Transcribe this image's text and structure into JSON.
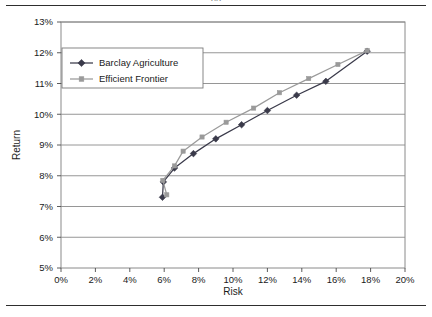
{
  "figure": {
    "top_rule": "horizontal-rule",
    "bottom_rule": "horizontal-rule",
    "clipped_title_fragment": "pg"
  },
  "chart_data": {
    "type": "line",
    "title": "",
    "xlabel": "Risk",
    "ylabel": "Return",
    "xlim": [
      0,
      20
    ],
    "ylim": [
      5,
      13
    ],
    "x_tick_labels": [
      "0%",
      "2%",
      "4%",
      "6%",
      "8%",
      "10%",
      "12%",
      "14%",
      "16%",
      "18%",
      "20%"
    ],
    "x_ticks": [
      0,
      2,
      4,
      6,
      8,
      10,
      12,
      14,
      16,
      18,
      20
    ],
    "y_tick_labels": [
      "5%",
      "6%",
      "7%",
      "8%",
      "9%",
      "10%",
      "11%",
      "12%",
      "13%"
    ],
    "y_ticks": [
      5,
      6,
      7,
      8,
      9,
      10,
      11,
      12,
      13
    ],
    "grid": "horizontal",
    "legend_position": "upper-left-inside",
    "series": [
      {
        "name": "Barclay Agriculture",
        "color": "#3a3a4a",
        "marker": "diamond",
        "points": [
          [
            5.9,
            7.3
          ],
          [
            5.95,
            7.8
          ],
          [
            6.6,
            8.25
          ],
          [
            7.7,
            8.72
          ],
          [
            9.0,
            9.2
          ],
          [
            10.5,
            9.66
          ],
          [
            12.0,
            10.12
          ],
          [
            13.7,
            10.62
          ],
          [
            15.4,
            11.07
          ],
          [
            17.8,
            12.05
          ]
        ]
      },
      {
        "name": "Efficient Frontier",
        "color": "#9a9a9a",
        "marker": "square",
        "points": [
          [
            6.15,
            7.38
          ],
          [
            5.92,
            7.85
          ],
          [
            6.6,
            8.32
          ],
          [
            7.1,
            8.8
          ],
          [
            8.2,
            9.26
          ],
          [
            9.6,
            9.74
          ],
          [
            11.2,
            10.2
          ],
          [
            12.7,
            10.7
          ],
          [
            14.4,
            11.16
          ],
          [
            16.1,
            11.62
          ],
          [
            17.8,
            12.07
          ]
        ]
      }
    ]
  }
}
